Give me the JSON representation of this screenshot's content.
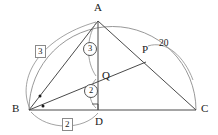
{
  "figure": {
    "kind": "plane-geometry-diagram",
    "canvas": {
      "width": 218,
      "height": 135,
      "background": "#ffffff"
    },
    "stroke_color": "#4a4a4a",
    "arc_color": "#8c8c8c",
    "text_color": "#1a1a1a"
  },
  "points": {
    "A": {
      "label": "A",
      "x": 98,
      "y": 21,
      "label_x": 94,
      "label_y": 3
    },
    "B": {
      "label": "B",
      "x": 29,
      "y": 110,
      "label_x": 13,
      "label_y": 104
    },
    "C": {
      "label": "C",
      "x": 196,
      "y": 110,
      "label_x": 201,
      "label_y": 104
    },
    "D": {
      "label": "D",
      "x": 98,
      "y": 110,
      "label_x": 95,
      "label_y": 116
    },
    "P": {
      "label": "P",
      "x": 146,
      "y": 62,
      "label_x": 143,
      "label_y": 48
    },
    "Q": {
      "label": "Q",
      "x": 98,
      "y": 77,
      "label_x": 102,
      "label_y": 71
    }
  },
  "segments": [
    {
      "name": "segment-BC",
      "from": "B",
      "to": "C"
    },
    {
      "name": "segment-BA",
      "from": "B",
      "to": "A"
    },
    {
      "name": "segment-AC",
      "from": "A",
      "to": "C"
    },
    {
      "name": "segment-AD",
      "from": "A",
      "to": "D"
    },
    {
      "name": "segment-BP",
      "from": "B",
      "to": "P"
    },
    {
      "name": "segment-AQ-to-B",
      "from": "A",
      "to": "B"
    }
  ],
  "arcs": {
    "semicircle": {
      "name": "semicircle-BC",
      "center_x": 112.5,
      "center_y": 110,
      "radius": 83.5
    },
    "measure_AB": {
      "name": "measure-arc-AB",
      "label": "3",
      "style": "boxed"
    },
    "measure_BD": {
      "name": "measure-arc-BD",
      "label": "2",
      "style": "boxed"
    },
    "measure_AQ": {
      "name": "measure-arc-AQ",
      "label": "3",
      "style": "circled"
    },
    "measure_QD": {
      "name": "measure-arc-QD",
      "label": "2",
      "style": "circled"
    },
    "measure_AC": {
      "name": "measure-arc-AC",
      "label": "20",
      "style": "plain"
    }
  },
  "labels": {
    "boxed_three": {
      "text": "3",
      "x": 36,
      "y": 47
    },
    "boxed_two": {
      "text": "2",
      "x": 63,
      "y": 119
    },
    "circled_three": {
      "text": "3",
      "x": 85,
      "y": 44
    },
    "circled_two": {
      "text": "2",
      "x": 86,
      "y": 86
    },
    "arc_twenty": {
      "text": "20",
      "x": 159,
      "y": 41
    }
  },
  "angle_marks": {
    "equal_angle_dots": [
      {
        "name": "angle-dot-upper",
        "x": 40,
        "y": 96
      },
      {
        "name": "angle-dot-lower",
        "x": 43,
        "y": 106
      }
    ],
    "right_angle_at_D": {
      "name": "right-angle-mark-D",
      "x": 92,
      "y": 104,
      "size": 6
    }
  }
}
